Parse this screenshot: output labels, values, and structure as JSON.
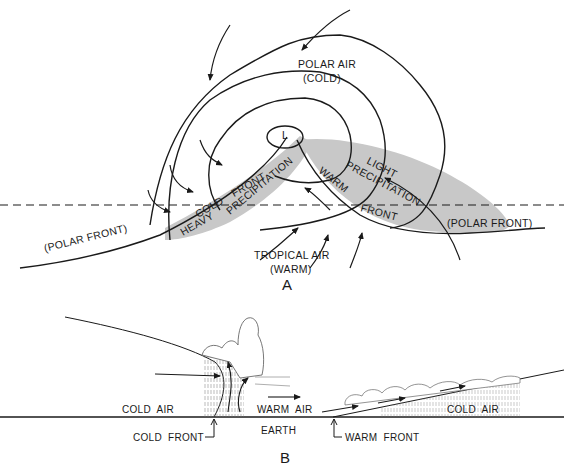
{
  "figure_a": {
    "panel_label": "A",
    "polar_air_line1": "POLAR AIR",
    "polar_air_line2": "(COLD)",
    "tropical_air_line1": "TROPICAL AIR",
    "tropical_air_line2": "(WARM)",
    "low_symbol": "L",
    "cold_front": "COLD FRONT",
    "heavy_precip_1": "HEAVY",
    "heavy_precip_2": "PRECIPITATION",
    "light_precip_1": "LIGHT",
    "light_precip_2": "PRECIPITATION",
    "warm_front_1": "WARM",
    "warm_front_2": "FRONT",
    "polar_front_left": "(POLAR FRONT)",
    "polar_front_right": "(POLAR FRONT)"
  },
  "figure_b": {
    "panel_label": "B",
    "cold_air_left": "COLD AIR",
    "warm_air": "WARM AIR",
    "cold_air_right": "COLD AIR",
    "earth": "EARTH",
    "cold_front": "COLD FRONT",
    "warm_front": "WARM FRONT"
  },
  "colors": {
    "line": "#1a1a1a",
    "shading": "#c8c8c8",
    "background": "#ffffff"
  }
}
